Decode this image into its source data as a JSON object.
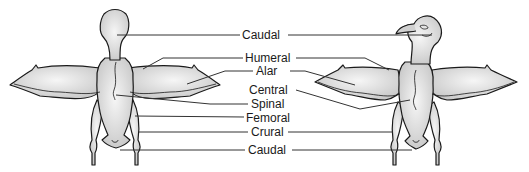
{
  "figure": {
    "labels": [
      {
        "id": "caudal-top",
        "text": "Caudal",
        "x": 241,
        "y": 29
      },
      {
        "id": "humeral",
        "text": "Humeral",
        "x": 245,
        "y": 53
      },
      {
        "id": "alar",
        "text": "Alar",
        "x": 256,
        "y": 66
      },
      {
        "id": "central",
        "text": "Central",
        "x": 249,
        "y": 84
      },
      {
        "id": "spinal",
        "text": "Spinal",
        "x": 251,
        "y": 99
      },
      {
        "id": "femoral",
        "text": "Femoral",
        "x": 246,
        "y": 113
      },
      {
        "id": "crural",
        "text": "Crural",
        "x": 251,
        "y": 126
      },
      {
        "id": "caudal-bottom",
        "text": "Caudal",
        "x": 248,
        "y": 144
      }
    ],
    "views": [
      "dorsal-view",
      "ventral-view"
    ],
    "colors": {
      "body_fill": "#d8d8d8",
      "outline": "#1a1a1a",
      "leader": "#333333"
    }
  }
}
